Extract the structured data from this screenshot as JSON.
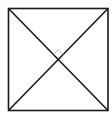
{
  "diagram": {
    "type": "geometry",
    "shapes": {
      "square": {
        "x1": 8.5,
        "y1": 8.5,
        "x2": 108,
        "y2": 110.5
      },
      "diagonal_1": {
        "from": "top-left",
        "to": "bottom-right"
      },
      "diagonal_2": {
        "from": "bottom-left",
        "to": "top-right"
      },
      "right_angle_marker": {
        "at": "intersection",
        "position": "top",
        "size": 6
      }
    },
    "colors": {
      "stroke": "#1a1a1a",
      "marker": "#bdbdbd",
      "background": "#ffffff"
    }
  }
}
